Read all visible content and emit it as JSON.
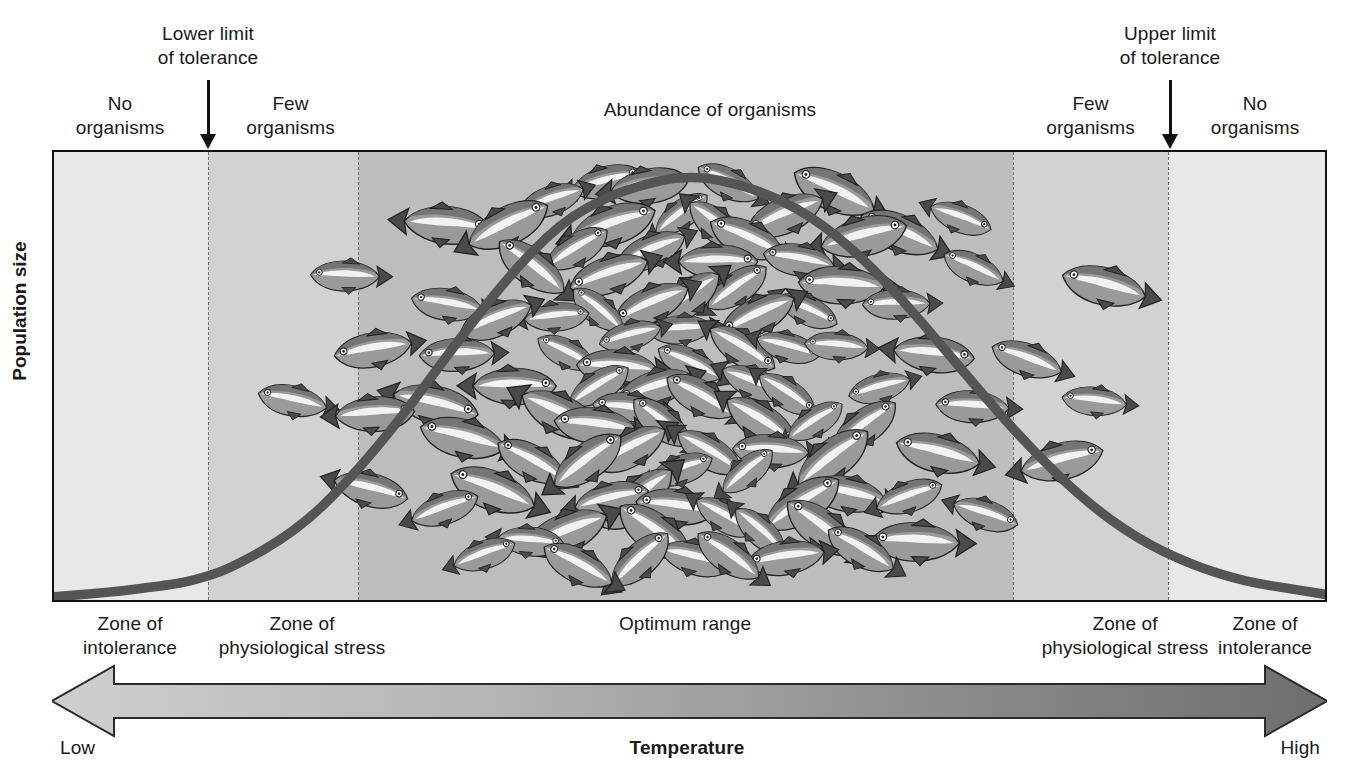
{
  "figure": {
    "y_axis_label": "Population size",
    "x_axis_label": "Temperature",
    "x_low_label": "Low",
    "x_high_label": "High"
  },
  "pointers": [
    {
      "id": "lower-limit",
      "text": "Lower limit\nof tolerance"
    },
    {
      "id": "upper-limit",
      "text": "Upper limit\nof tolerance"
    }
  ],
  "top_labels": [
    {
      "id": "no-organisms-left",
      "text": "No\norganisms"
    },
    {
      "id": "few-organisms-left",
      "text": "Few\norganisms"
    },
    {
      "id": "abundance",
      "text": "Abundance of organisms"
    },
    {
      "id": "few-organisms-right",
      "text": "Few\norganisms"
    },
    {
      "id": "no-organisms-right",
      "text": "No\norganisms"
    }
  ],
  "zone_labels": [
    {
      "id": "zone-intolerance-left",
      "text": "Zone of\nintolerance"
    },
    {
      "id": "zone-stress-left",
      "text": "Zone of\nphysiological stress"
    },
    {
      "id": "optimum-range",
      "text": "Optimum range"
    },
    {
      "id": "zone-stress-right",
      "text": "Zone of\nphysiological stress"
    },
    {
      "id": "zone-intolerance-right",
      "text": "Zone of\nintolerance"
    }
  ],
  "colors": {
    "band_outer": "#e8e8e8",
    "band_mid": "#d2d2d2",
    "band_optimum": "#bdbdbd",
    "curve": "#555555",
    "frame": "#111111",
    "arrow_light": "#c9c9c9",
    "arrow_dark": "#6e6e6e",
    "fish_body": "#9a9a9a",
    "fish_dark": "#4a4a4a",
    "text": "#1a1a1a"
  },
  "chart_data": {
    "type": "line",
    "xlabel": "Temperature",
    "ylabel": "Population size",
    "xlim": [
      0,
      100
    ],
    "ylim": [
      0,
      100
    ],
    "grid": false,
    "legend": "none",
    "curve_name": "Population size",
    "x": [
      0,
      5,
      10,
      12,
      15,
      20,
      24,
      28,
      32,
      36,
      40,
      44,
      48,
      50,
      52,
      56,
      60,
      64,
      68,
      72,
      76,
      80,
      84,
      88,
      92,
      96,
      100
    ],
    "y": [
      0,
      1,
      3,
      4,
      7,
      16,
      28,
      43,
      60,
      76,
      89,
      96,
      99.5,
      100,
      99.5,
      96,
      89,
      78,
      64,
      49,
      35,
      23,
      14,
      8,
      4,
      2,
      0
    ],
    "bands": [
      {
        "label": "Zone of intolerance",
        "x_start": 0,
        "x_end": 12.2,
        "shade": "#e8e8e8",
        "organisms": "No organisms"
      },
      {
        "label": "Zone of physiological stress",
        "x_start": 12.2,
        "x_end": 24.0,
        "shade": "#d2d2d2",
        "organisms": "Few organisms"
      },
      {
        "label": "Optimum range",
        "x_start": 24.0,
        "x_end": 75.4,
        "shade": "#bdbdbd",
        "organisms": "Abundance of organisms"
      },
      {
        "label": "Zone of physiological stress",
        "x_start": 75.4,
        "x_end": 87.7,
        "shade": "#d2d2d2",
        "organisms": "Few organisms"
      },
      {
        "label": "Zone of intolerance",
        "x_start": 87.7,
        "x_end": 100,
        "shade": "#e8e8e8",
        "organisms": "No organisms"
      }
    ],
    "annotations": [
      {
        "text": "Lower limit of tolerance",
        "x": 12.2,
        "type": "arrow-down"
      },
      {
        "text": "Upper limit of tolerance",
        "x": 87.7,
        "type": "arrow-down"
      }
    ]
  }
}
